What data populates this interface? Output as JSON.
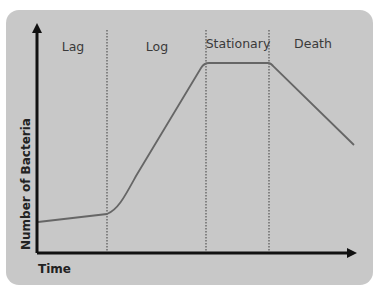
{
  "diagram": {
    "phases": [
      {
        "label": "Lag"
      },
      {
        "label": "Log"
      },
      {
        "label": "Stationary"
      },
      {
        "label": "Death"
      }
    ],
    "x_axis_label": "Time",
    "y_axis_label": "Number of Bacteria"
  },
  "colors": {
    "panel_bg": "#c8c8c8",
    "curve": "#666666",
    "axis": "#111111",
    "divider": "#555555"
  }
}
